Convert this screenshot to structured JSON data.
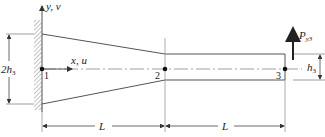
{
  "diagram": {
    "type": "tapered cantilever beam with fixed support",
    "colors": {
      "line": "#555555",
      "thin_line": "#777777",
      "node": "#111111",
      "text": "#222222",
      "hatch": "#888888"
    },
    "axes": {
      "vertical_label": "y, v",
      "horizontal_label": "x, u"
    },
    "nodes": [
      {
        "id": "1",
        "label": "1"
      },
      {
        "id": "2",
        "label": "2"
      },
      {
        "id": "3",
        "label": "3"
      }
    ],
    "dimensions": {
      "root_height": {
        "label_main": "2h",
        "label_sub": "3"
      },
      "tip_height": {
        "label_main": "h",
        "label_sub": "3"
      },
      "segment_1_length": "L",
      "segment_2_length": "L"
    },
    "load": {
      "label_main": "P",
      "label_sub": "y3",
      "direction": "up",
      "node": "3"
    },
    "support": "fixed wall (hatched) at node 1"
  }
}
